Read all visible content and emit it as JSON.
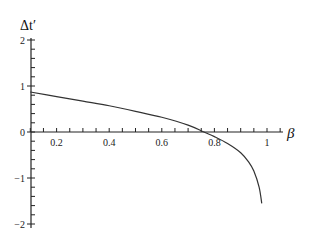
{
  "chart_data": {
    "type": "line",
    "title": "",
    "xlabel": "β",
    "ylabel": "Δt′",
    "xlim": [
      0.1,
      1.05
    ],
    "ylim": [
      -2,
      2
    ],
    "grid": false,
    "legend": null,
    "x_ticks": [
      "0.2",
      "0.4",
      "0.6",
      "0.8",
      "1"
    ],
    "y_ticks": [
      "2",
      "1",
      "0",
      "-1",
      "-2"
    ],
    "series": [
      {
        "name": "Δt′(β)",
        "x": [
          0.1,
          0.2,
          0.3,
          0.4,
          0.5,
          0.6,
          0.7,
          0.76,
          0.8,
          0.85,
          0.9,
          0.93,
          0.95,
          0.97,
          0.98
        ],
        "y": [
          0.87,
          0.77,
          0.67,
          0.57,
          0.45,
          0.32,
          0.15,
          0.0,
          -0.1,
          -0.25,
          -0.45,
          -0.65,
          -0.85,
          -1.2,
          -1.55
        ]
      }
    ]
  },
  "labels": {
    "xlabel": "β",
    "ylabel": "Δt′",
    "x_ticks": [
      "0.2",
      "0.4",
      "0.6",
      "0.8",
      "1"
    ],
    "y_ticks": [
      "2",
      "1",
      "0",
      "-1",
      "-2"
    ]
  }
}
